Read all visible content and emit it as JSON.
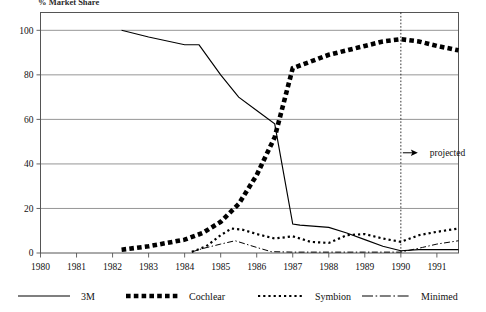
{
  "title": "% Market Share",
  "annotation": {
    "projected_label": "projected",
    "projected_year": 1990,
    "arrow_icon": "arrow-right-icon"
  },
  "legend": {
    "items": [
      {
        "label": "3M",
        "style": "solid",
        "marker": "line-solid-icon"
      },
      {
        "label": "Cochlear",
        "style": "thick-dotted",
        "marker": "squares-icon"
      },
      {
        "label": "Symbion",
        "style": "fine-dotted",
        "marker": "dots-icon"
      },
      {
        "label": "Minimed",
        "style": "dash-dot",
        "marker": "dash-dot-icon"
      }
    ]
  },
  "axes": {
    "y_ticks": [
      "0",
      "20",
      "40",
      "60",
      "80",
      "100"
    ],
    "x_ticks": [
      "1980",
      "1981",
      "1982",
      "1983",
      "1984",
      "1985",
      "1986",
      "1987",
      "1988",
      "1989",
      "1990",
      "1991"
    ]
  },
  "chart_data": {
    "type": "line",
    "title": "% Market Share",
    "xlabel": "",
    "ylabel": "% Market Share",
    "xlim": [
      1980,
      1991.6
    ],
    "ylim": [
      0,
      108
    ],
    "yticks": [
      0,
      20,
      40,
      60,
      80,
      100
    ],
    "xticks": [
      1980,
      1981,
      1982,
      1983,
      1984,
      1985,
      1986,
      1987,
      1988,
      1989,
      1990,
      1991
    ],
    "grid": "horizontal",
    "legend_position": "below",
    "annotations": [
      {
        "text": "projected",
        "x": 1990,
        "y": 45,
        "type": "vertical-divider-with-arrow"
      }
    ],
    "x": [
      1982.25,
      1982.5,
      1983,
      1983.5,
      1984,
      1984.5,
      1985,
      1985.5,
      1986,
      1986.5,
      1987,
      1987.5,
      1988,
      1988.5,
      1989,
      1989.5,
      1990,
      1990.5,
      1991,
      1991.6
    ],
    "series": [
      {
        "name": "3M",
        "style": "solid",
        "x": [
          1982.25,
          1983,
          1984,
          1984.4,
          1985,
          1985.5,
          1986,
          1986.5,
          1987,
          1987.2,
          1988,
          1988.5,
          1989,
          1989.5,
          1990,
          1990.5,
          1991,
          1991.6
        ],
        "values": [
          100,
          97,
          93.5,
          93.5,
          80,
          70,
          64,
          58,
          13,
          12.5,
          11.5,
          9,
          6,
          3,
          1,
          1.5,
          1.5,
          1.5
        ]
      },
      {
        "name": "Cochlear",
        "style": "thick-dotted",
        "x": [
          1982.25,
          1983,
          1984,
          1984.5,
          1985,
          1985.5,
          1986,
          1986.5,
          1987,
          1987.5,
          1988,
          1988.5,
          1989,
          1989.5,
          1990,
          1990.5,
          1991,
          1991.6
        ],
        "values": [
          1.5,
          3,
          6,
          9,
          14,
          22,
          35,
          52,
          83,
          86,
          89,
          91,
          93,
          95,
          96,
          95,
          93,
          91
        ]
      },
      {
        "name": "Symbion",
        "style": "fine-dotted",
        "x": [
          1984.2,
          1984.6,
          1985,
          1985.3,
          1985.6,
          1986,
          1986.5,
          1987,
          1987.5,
          1988,
          1988.5,
          1989,
          1989.5,
          1990,
          1990.5,
          1991,
          1991.6
        ],
        "values": [
          0.5,
          3,
          8,
          11,
          10.5,
          8.5,
          6.5,
          7.5,
          5,
          4.5,
          8,
          8.5,
          6.5,
          5,
          8,
          9.5,
          11
        ]
      },
      {
        "name": "Minimed",
        "style": "dash-dot",
        "x": [
          1984.2,
          1984.5,
          1985,
          1985.4,
          1986,
          1986.4,
          1987,
          1988,
          1989,
          1990,
          1990.6,
          1991,
          1991.6
        ],
        "values": [
          0.5,
          2,
          4,
          5.5,
          2.5,
          0.6,
          0.4,
          0.4,
          0.4,
          0.4,
          2.5,
          4,
          5.5
        ]
      }
    ]
  }
}
